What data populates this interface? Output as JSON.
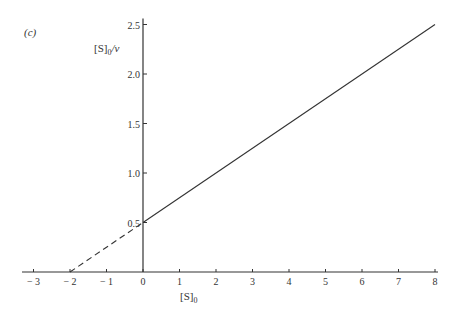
{
  "chart_data": {
    "type": "line",
    "panel_label": "(c)",
    "title": "",
    "xlabel": "[S]0",
    "ylabel": "[S]0/v",
    "xlim": [
      -3.3,
      8
    ],
    "ylim": [
      0,
      2.5
    ],
    "x_ticks": [
      -3,
      -2,
      -1,
      0,
      1,
      2,
      3,
      4,
      5,
      6,
      7,
      8
    ],
    "x_tick_labels": [
      "− 3",
      "− 2",
      "− 1",
      "0",
      "1",
      "2",
      "3",
      "4",
      "5",
      "6",
      "7",
      "8"
    ],
    "y_ticks": [
      0.5,
      1.0,
      1.5,
      2.0,
      2.5
    ],
    "y_tick_labels": [
      "0.5",
      "1.0",
      "1.5",
      "2.0",
      "2.5"
    ],
    "grid": false,
    "series": [
      {
        "name": "measured line",
        "style": "solid",
        "x": [
          0,
          8
        ],
        "y": [
          0.5,
          2.5
        ]
      },
      {
        "name": "extrapolation",
        "style": "dashed",
        "x": [
          -2,
          0
        ],
        "y": [
          0,
          0.5
        ]
      }
    ],
    "y_intercept": 0.5,
    "x_intercept": -2,
    "slope": 0.25
  }
}
